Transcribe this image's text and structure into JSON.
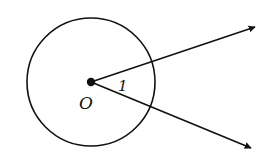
{
  "diagram": {
    "type": "geometry",
    "stroke_color": "#111111",
    "background": "#ffffff",
    "circle": {
      "center": [
        91,
        82
      ],
      "radius": 64
    },
    "center_point": {
      "label": "O",
      "position": [
        91,
        82
      ]
    },
    "rays": [
      {
        "name": "upper-ray",
        "from": [
          91,
          82
        ],
        "to": [
          255,
          27
        ]
      },
      {
        "name": "lower-ray",
        "from": [
          91,
          82
        ],
        "to": [
          251,
          148
        ]
      }
    ],
    "angle": {
      "label": "1",
      "vertex": "O"
    },
    "labels": {
      "center": "O",
      "angle": "1"
    }
  }
}
